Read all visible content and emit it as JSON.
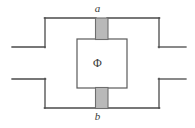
{
  "figure": {
    "type": "circuit-diagram",
    "canvas": {
      "width": 195,
      "height": 128,
      "background": "#ffffff"
    },
    "colors": {
      "wire_stroke": "#4a4a4a",
      "junction_fill": "#b9b9b9",
      "junction_stroke": "#6e6e6e",
      "inner_box_fill": "#ffffff",
      "inner_box_stroke": "#5a5a5a",
      "label_color": "#3a3a3a"
    },
    "labels": {
      "junction_top": "a",
      "junction_bottom": "b",
      "flux": "Φ"
    },
    "geometry": {
      "outer_loop": {
        "left": 45,
        "right": 159,
        "top": 18,
        "bottom": 108
      },
      "leads": [
        {
          "name": "lead-top-left",
          "x1": 12,
          "y1": 47,
          "x2": 45,
          "y2": 47
        },
        {
          "name": "lead-bottom-left",
          "x1": 12,
          "y1": 79,
          "x2": 45,
          "y2": 79
        },
        {
          "name": "lead-top-right",
          "x1": 159,
          "y1": 47,
          "x2": 186,
          "y2": 47
        },
        {
          "name": "lead-bottom-right",
          "x1": 159,
          "y1": 79,
          "x2": 186,
          "y2": 79
        }
      ],
      "inner_box": {
        "x": 77,
        "y": 39,
        "width": 50,
        "height": 49
      },
      "junction_top": {
        "x": 95,
        "y": 18,
        "width": 13,
        "height": 22
      },
      "junction_bottom": {
        "x": 95,
        "y": 87,
        "width": 13,
        "height": 22
      }
    }
  }
}
